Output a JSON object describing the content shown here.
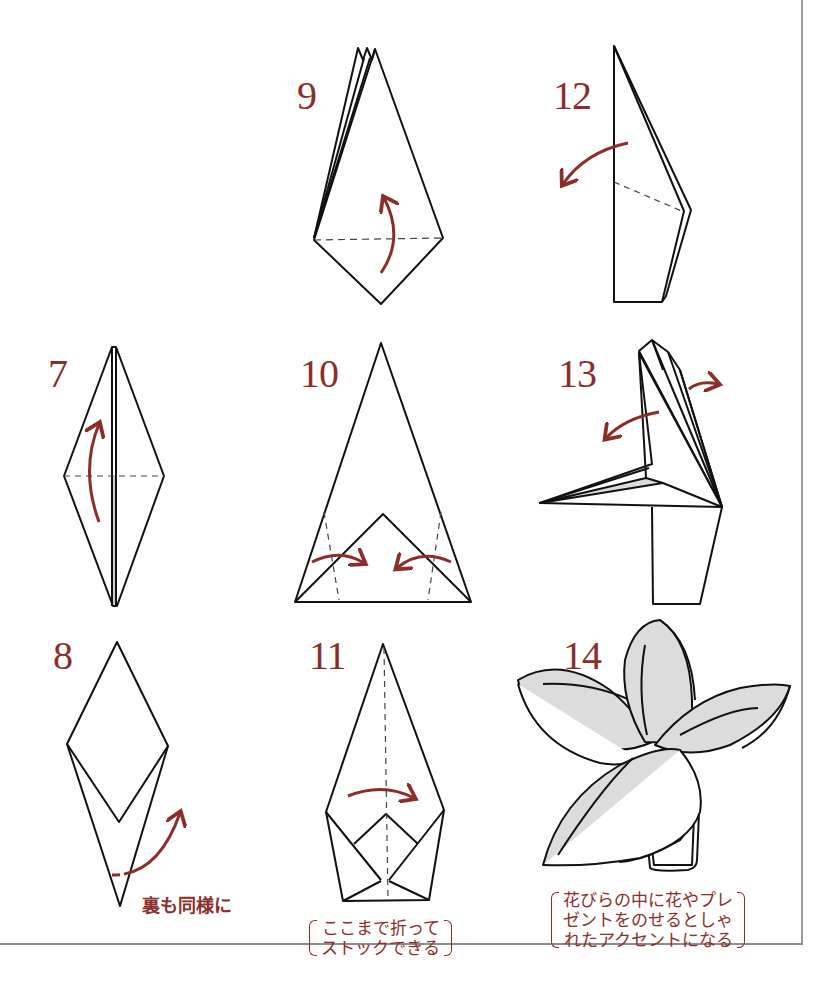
{
  "page": {
    "colors": {
      "accent": "#8b2e2a",
      "line": "#111111",
      "shade": "#dcdcdc",
      "frame": "#9a9a9a"
    }
  },
  "steps": [
    {
      "number": "7",
      "diagram": "diamond-with-vertical-fold-and-horizontal-crease",
      "arrow": "curved-up-arrow"
    },
    {
      "number": "8",
      "diagram": "diamond-with-v-flap",
      "arrow": "curved-up-arrow-with-dashed-tail",
      "note": "裏も同様に"
    },
    {
      "number": "9",
      "diagram": "kite-with-layered-tips",
      "arrow": "curved-up-arrow"
    },
    {
      "number": "10",
      "diagram": "tall-triangle-with-inner-triangle",
      "arrow": "two-inward-curved-arrows"
    },
    {
      "number": "11",
      "diagram": "pointed-shape-with-folded-base",
      "arrow": "curved-right-arrow",
      "note_lines": [
        "ここまで折って",
        "ストックできる"
      ]
    },
    {
      "number": "12",
      "diagram": "side-view-folded-strip",
      "arrow": "curved-left-arrow"
    },
    {
      "number": "13",
      "diagram": "opening-petals-side-view",
      "arrow": "two-outward-curved-arrows"
    },
    {
      "number": "14",
      "diagram": "finished-flower-with-four-petals",
      "note_lines": [
        "花びらの中に花やプレ",
        "ゼントをのせるとしゃ",
        "れたアクセントになる"
      ]
    }
  ]
}
